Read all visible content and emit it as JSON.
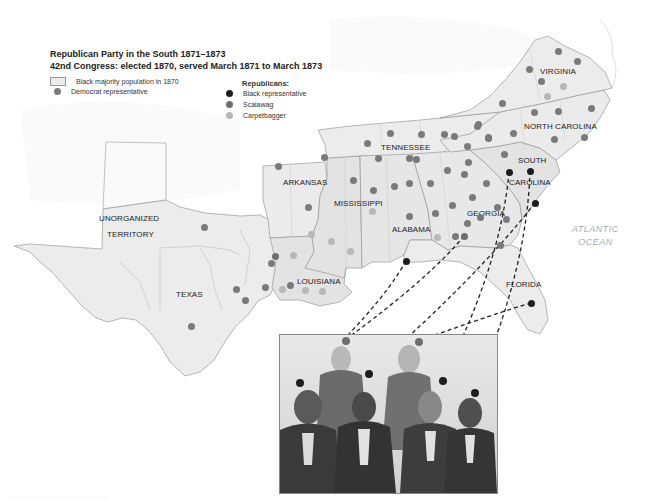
{
  "title": {
    "line1": "Republican Party in the South 1871–1873",
    "line2": "42nd Congress: elected 1870, served March 1871 to March 1873"
  },
  "legend": {
    "black_majority": "Black majority population in 1870",
    "democrat": "Democrat representative",
    "republicans_heading": "Republicans:",
    "black_rep": "Black representative",
    "scalawag": "Scalawag",
    "carpetbagger": "Carpetbagger"
  },
  "colors": {
    "democrat": "#7a7a7a",
    "black_rep": "#1e1e1e",
    "scalawag": "#6e6e6e",
    "carpetbagger": "#b8b8b8",
    "land": "#eeeeee",
    "black_majority_fill": "#e3e3e3",
    "border": "#9a9a9a",
    "ocean_label": "#aaaaaa",
    "connector": "#222222"
  },
  "states": [
    {
      "name": "VIRGINIA",
      "x": 540,
      "y": 67
    },
    {
      "name": "NORTH CAROLINA",
      "x": 524,
      "y": 122
    },
    {
      "name": "SOUTH",
      "x": 518,
      "y": 156
    },
    {
      "name": "CAROLINA",
      "x": 509,
      "y": 178
    },
    {
      "name": "TENNESSEE",
      "x": 381,
      "y": 143
    },
    {
      "name": "ARKANSAS",
      "x": 283,
      "y": 178
    },
    {
      "name": "MISSISSIPPI",
      "x": 334,
      "y": 199
    },
    {
      "name": "ALABAMA",
      "x": 392,
      "y": 225
    },
    {
      "name": "GEORGIA",
      "x": 467,
      "y": 209
    },
    {
      "name": "FLORIDA",
      "x": 506,
      "y": 280
    },
    {
      "name": "LOUISIANA",
      "x": 297,
      "y": 277
    },
    {
      "name": "TEXAS",
      "x": 176,
      "y": 290
    },
    {
      "name": "UNORGANIZED",
      "x": 99,
      "y": 214
    },
    {
      "name": "TERRITORY",
      "x": 107,
      "y": 230
    }
  ],
  "ocean": {
    "line1": "ATLANTIC",
    "line2": "OCEAN"
  },
  "representatives": {
    "democrat": [
      [
        558,
        51
      ],
      [
        577,
        61
      ],
      [
        529,
        69
      ],
      [
        541,
        81
      ],
      [
        502,
        103
      ],
      [
        534,
        112
      ],
      [
        558,
        111
      ],
      [
        591,
        108
      ],
      [
        477,
        126
      ],
      [
        488,
        138
      ],
      [
        513,
        133
      ],
      [
        554,
        139
      ],
      [
        584,
        137
      ],
      [
        454,
        136
      ],
      [
        504,
        154
      ],
      [
        467,
        146
      ],
      [
        367,
        143
      ],
      [
        390,
        133
      ],
      [
        421,
        134
      ],
      [
        444,
        134
      ],
      [
        478,
        124
      ],
      [
        488,
        137
      ],
      [
        378,
        158
      ],
      [
        409,
        158
      ],
      [
        416,
        159
      ],
      [
        468,
        162
      ],
      [
        278,
        166
      ],
      [
        324,
        157
      ],
      [
        308,
        207
      ],
      [
        353,
        180
      ],
      [
        373,
        190
      ],
      [
        394,
        186
      ],
      [
        409,
        183
      ],
      [
        430,
        183
      ],
      [
        447,
        170
      ],
      [
        464,
        174
      ],
      [
        486,
        183
      ],
      [
        409,
        216
      ],
      [
        435,
        213
      ],
      [
        452,
        205
      ],
      [
        472,
        197
      ],
      [
        497,
        207
      ],
      [
        480,
        217
      ],
      [
        455,
        236
      ],
      [
        506,
        219
      ],
      [
        500,
        245
      ],
      [
        467,
        223
      ],
      [
        204,
        227
      ],
      [
        236,
        289
      ],
      [
        271,
        263
      ],
      [
        191,
        326
      ],
      [
        245,
        300
      ],
      [
        290,
        285
      ],
      [
        265,
        287
      ]
    ],
    "carpetbagger": [
      [
        547,
        96
      ],
      [
        563,
        86
      ],
      [
        372,
        211
      ],
      [
        331,
        241
      ],
      [
        311,
        234
      ],
      [
        350,
        251
      ],
      [
        293,
        255
      ],
      [
        282,
        289
      ],
      [
        305,
        290
      ],
      [
        322,
        291
      ],
      [
        437,
        237
      ]
    ],
    "scalawag": [
      [
        464,
        236
      ],
      [
        275,
        256
      ]
    ],
    "black": [
      [
        509,
        172
      ],
      [
        530,
        171
      ],
      [
        535,
        203
      ],
      [
        406,
        261
      ],
      [
        531,
        303
      ]
    ]
  },
  "portrait": {
    "pins": [
      {
        "x": 299,
        "y": 382,
        "color": "black"
      },
      {
        "x": 345,
        "y": 340,
        "color": "scalawag"
      },
      {
        "x": 368,
        "y": 373,
        "color": "black"
      },
      {
        "x": 418,
        "y": 341,
        "color": "scalawag"
      },
      {
        "x": 442,
        "y": 380,
        "color": "black"
      },
      {
        "x": 474,
        "y": 392,
        "color": "black"
      }
    ],
    "figure_count": 7
  },
  "connectors": [
    {
      "from": [
        406,
        261
      ],
      "to": [
        299,
        382
      ]
    },
    {
      "from": [
        464,
        236
      ],
      "to": [
        345,
        340
      ]
    },
    {
      "from": [
        535,
        203
      ],
      "to": [
        368,
        373
      ]
    },
    {
      "from": [
        531,
        303
      ],
      "to": [
        418,
        341
      ]
    },
    {
      "from": [
        509,
        172
      ],
      "to": [
        442,
        380
      ]
    },
    {
      "from": [
        530,
        171
      ],
      "to": [
        474,
        392
      ]
    }
  ],
  "footer": "· · · · · · · · · · · · · · · · · · · · · · · · · · · · · · · ·"
}
